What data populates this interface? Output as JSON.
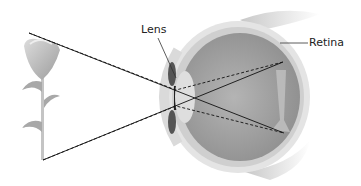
{
  "diagram": {
    "type": "eye-image-formation",
    "labels": {
      "lens": "Lens",
      "retina": "Retina"
    },
    "object": "flower",
    "rays": {
      "object_top": [
        29,
        33
      ],
      "object_bottom": [
        43,
        160
      ],
      "lens_center": [
        178,
        97
      ],
      "image_top": [
        283,
        62
      ],
      "image_bottom": [
        284,
        133
      ],
      "solid_description": "chief rays through lens center, crossing and inverting image on retina",
      "dashed_description": "marginal rays through lens edges"
    },
    "colors": {
      "ray": "#111111",
      "eye_fill": "#9a9a9a",
      "sclera": "#d8d8d8",
      "flower": "#b5b5b5"
    }
  }
}
